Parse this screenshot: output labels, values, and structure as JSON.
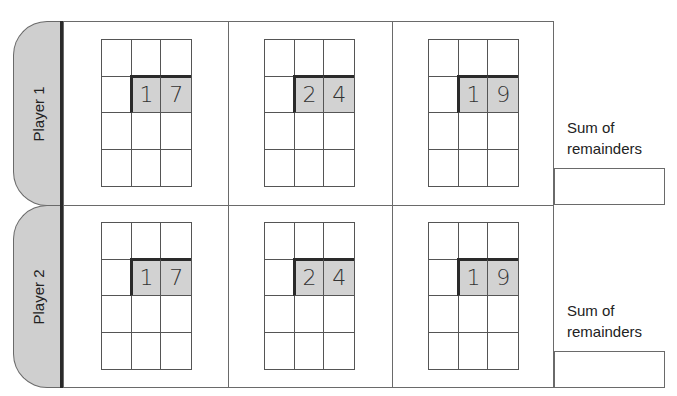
{
  "players": [
    {
      "label": "Player 1",
      "problems": [
        {
          "dividend_digits": [
            "1",
            "7"
          ]
        },
        {
          "dividend_digits": [
            "2",
            "4"
          ]
        },
        {
          "dividend_digits": [
            "1",
            "9"
          ]
        }
      ],
      "sum_label": "Sum of remainders",
      "sum_value": ""
    },
    {
      "label": "Player 2",
      "problems": [
        {
          "dividend_digits": [
            "1",
            "7"
          ]
        },
        {
          "dividend_digits": [
            "2",
            "4"
          ]
        },
        {
          "dividend_digits": [
            "1",
            "9"
          ]
        }
      ],
      "sum_label": "Sum of remainders",
      "sum_value": ""
    }
  ],
  "colors": {
    "tab_fill": "#cfcfcf",
    "shaded_cell": "#d2d2d2",
    "rule": "#2a2a2a"
  }
}
